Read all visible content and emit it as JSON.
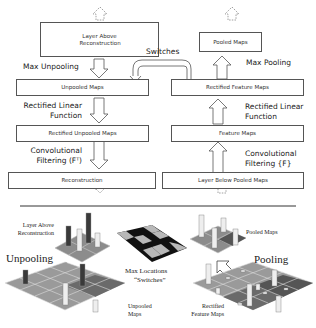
{
  "deconvnet": {
    "boxes": {
      "layer_above": "Layer Above Reconstruction",
      "unpooled_maps": "Unpooled Maps",
      "rectified_unpooled_maps": "Rectified Unpooled Maps",
      "reconstruction": "Reconstruction"
    },
    "labels": {
      "max_unpooling": "Max Unpooling",
      "relu": "Rectified Linear Function",
      "conv_filtering": "Convolutional Filtering (Fᵀ)"
    }
  },
  "convnet": {
    "boxes": {
      "pooled_maps": "Pooled Maps",
      "rectified_feature_maps": "Rectified Feature Maps",
      "feature_maps": "Feature Maps",
      "layer_below": "Layer Below Pooled Maps"
    },
    "labels": {
      "max_pooling": "Max Pooling",
      "relu": "Rectified Linear Function",
      "conv_filtering": "Convolutional Filtering {F}"
    }
  },
  "switches_label": "Switches",
  "illustration": {
    "layer_above_reconstruction": "Layer Above Reconstruction",
    "unpooling": "Unpooling",
    "unpooled_maps": "Unpooled Maps",
    "max_locations": "Max Locations",
    "switches": "“Switches”",
    "pooled_maps": "Pooled Maps",
    "pooling": "Pooling",
    "rectified_feature_maps": "Rectified Feature Maps"
  },
  "colors": {
    "border": "#555555",
    "dark_cell": "#111111",
    "light_cell": "#b8b8b8",
    "grid_mid": "#8a8a8a"
  }
}
